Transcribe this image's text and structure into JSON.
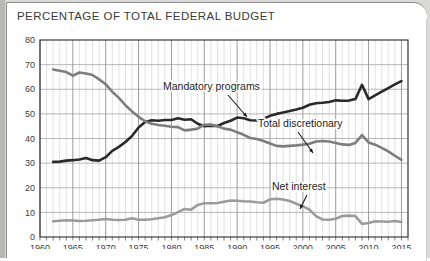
{
  "page": {
    "title": "PERCENTAGE OF TOTAL FEDERAL BUDGET",
    "background_color": "#d9d9d7",
    "card_color": "#ffffff"
  },
  "chart_data": {
    "type": "line",
    "title": "PERCENTAGE OF TOTAL FEDERAL BUDGET",
    "xlabel": "",
    "ylabel": "",
    "xlim": [
      1960,
      2016
    ],
    "ylim": [
      0,
      80
    ],
    "grid": true,
    "legend_position": "inline-annotations",
    "yticks": [
      0,
      10,
      20,
      30,
      40,
      50,
      60,
      70,
      80
    ],
    "xticks": [
      1960,
      1965,
      1970,
      1975,
      1980,
      1985,
      1990,
      1995,
      2000,
      2005,
      2010,
      2015
    ],
    "xtick_minor_step": 1,
    "x": [
      1962,
      1963,
      1964,
      1965,
      1966,
      1967,
      1968,
      1969,
      1970,
      1971,
      1972,
      1973,
      1974,
      1975,
      1976,
      1977,
      1978,
      1979,
      1980,
      1981,
      1982,
      1983,
      1984,
      1985,
      1986,
      1987,
      1988,
      1989,
      1990,
      1991,
      1992,
      1993,
      1994,
      1995,
      1996,
      1997,
      1998,
      1999,
      2000,
      2001,
      2002,
      2003,
      2004,
      2005,
      2006,
      2007,
      2008,
      2009,
      2010,
      2011,
      2012,
      2013,
      2014,
      2015
    ],
    "series": [
      {
        "name": "Mandatory programs",
        "color": "#2a2a2a",
        "values": [
          30.5,
          30.6,
          31.0,
          31.2,
          31.5,
          32.1,
          31.2,
          31.0,
          32.4,
          35.0,
          36.6,
          38.6,
          41.0,
          44.5,
          46.7,
          47.4,
          47.2,
          47.5,
          47.5,
          48.2,
          47.6,
          47.8,
          46.0,
          45.0,
          45.2,
          45.1,
          46.3,
          47.2,
          48.5,
          48.2,
          47.4,
          47.3,
          48.0,
          49.2,
          50.0,
          50.6,
          51.2,
          51.8,
          52.5,
          53.7,
          54.3,
          54.5,
          54.8,
          55.5,
          55.3,
          55.4,
          56.0,
          61.8,
          56.0,
          57.5,
          59.0,
          60.5,
          62.0,
          63.3
        ]
      },
      {
        "name": "Total discretionary",
        "color": "#7d7d7d",
        "values": [
          68.0,
          67.5,
          67.0,
          65.5,
          66.8,
          66.4,
          65.8,
          64.0,
          62.0,
          59.0,
          56.5,
          53.5,
          51.0,
          48.8,
          47.0,
          46.0,
          45.5,
          45.2,
          44.8,
          44.6,
          43.3,
          43.6,
          44.0,
          45.6,
          45.7,
          45.0,
          44.0,
          43.6,
          42.5,
          41.5,
          40.2,
          39.8,
          39.0,
          38.0,
          37.0,
          36.8,
          37.0,
          37.2,
          37.5,
          37.9,
          38.8,
          39.0,
          38.8,
          38.2,
          37.6,
          37.4,
          38.2,
          41.4,
          38.4,
          37.5,
          36.2,
          34.8,
          33.0,
          31.3
        ]
      },
      {
        "name": "Net interest",
        "color": "#9b9b9b",
        "values": [
          6.4,
          6.6,
          6.8,
          6.7,
          6.5,
          6.6,
          6.8,
          7.0,
          7.3,
          7.0,
          6.9,
          7.0,
          7.6,
          7.0,
          7.0,
          7.2,
          7.6,
          8.0,
          8.9,
          10.1,
          11.4,
          11.1,
          13.0,
          13.7,
          13.7,
          13.8,
          14.3,
          14.8,
          14.7,
          14.5,
          14.4,
          14.1,
          13.9,
          15.3,
          15.5,
          15.2,
          14.6,
          13.5,
          12.5,
          11.1,
          8.5,
          7.1,
          7.0,
          7.4,
          8.5,
          8.7,
          8.5,
          5.3,
          5.7,
          6.4,
          6.3,
          6.2,
          6.5,
          6.1
        ]
      }
    ],
    "annotations": [
      {
        "text": "Mandatory programs",
        "target_series": "Mandatory programs",
        "label_x": 163,
        "label_y": 90,
        "arrow_from_x": 228,
        "arrow_from_y": 95,
        "arrow_to_x": 247,
        "arrow_to_y": 117
      },
      {
        "text": "Total discretionary",
        "target_series": "Total discretionary",
        "label_x": 258,
        "label_y": 127,
        "arrow_from_x": 298,
        "arrow_from_y": 132,
        "arrow_to_x": 313,
        "arrow_to_y": 153
      },
      {
        "text": "Net interest",
        "target_series": "Net interest",
        "label_x": 272,
        "label_y": 190,
        "arrow_from_x": 307,
        "arrow_from_y": 195,
        "arrow_to_x": 300,
        "arrow_to_y": 209
      }
    ]
  }
}
